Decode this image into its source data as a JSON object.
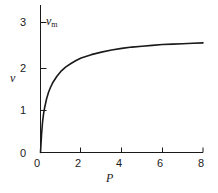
{
  "figure": {
    "background_color": "#ffffff",
    "line_color": "#1a1a1a"
  },
  "chart_data": {
    "type": "line",
    "title": "",
    "subtitle": "",
    "xlabel": "P",
    "ylabel": "v",
    "xlim": [
      0,
      8
    ],
    "ylim": [
      0,
      3.2
    ],
    "grid": false,
    "legend": null,
    "xticks": [
      0,
      2,
      4,
      6,
      8
    ],
    "xticklabels": [
      "0",
      "2",
      "4",
      "6",
      "8"
    ],
    "yticks": [
      0,
      1,
      2,
      3
    ],
    "yticklabels": [
      "0",
      "1",
      "2",
      "3"
    ],
    "annotations": [
      {
        "text": "v",
        "subscript": "m",
        "value": 3,
        "description": "maximum velocity asymptote label at top of y axis"
      }
    ],
    "series": [
      {
        "name": "saturation curve",
        "x": [
          0.0,
          0.05,
          0.1,
          0.15,
          0.2,
          0.3,
          0.4,
          0.5,
          0.6,
          0.8,
          1.0,
          1.25,
          1.5,
          1.75,
          2.0,
          2.5,
          3.0,
          3.5,
          4.0,
          4.5,
          5.0,
          5.5,
          6.0,
          6.5,
          7.0,
          7.5,
          8.0
        ],
        "y": [
          0.0,
          0.42,
          0.72,
          0.92,
          1.06,
          1.28,
          1.44,
          1.56,
          1.66,
          1.81,
          1.93,
          2.04,
          2.12,
          2.19,
          2.25,
          2.33,
          2.39,
          2.44,
          2.48,
          2.51,
          2.53,
          2.55,
          2.57,
          2.58,
          2.59,
          2.6,
          2.61
        ]
      }
    ]
  },
  "labels": {
    "y3": "3",
    "y2": "2",
    "y1": "1",
    "y0": "0",
    "x0": "0",
    "x2": "2",
    "x4": "4",
    "x6": "6",
    "x8": "8",
    "x_axis_title": "P",
    "y_axis_title": "v",
    "vm_symbol": "v",
    "vm_subscript": "m"
  }
}
